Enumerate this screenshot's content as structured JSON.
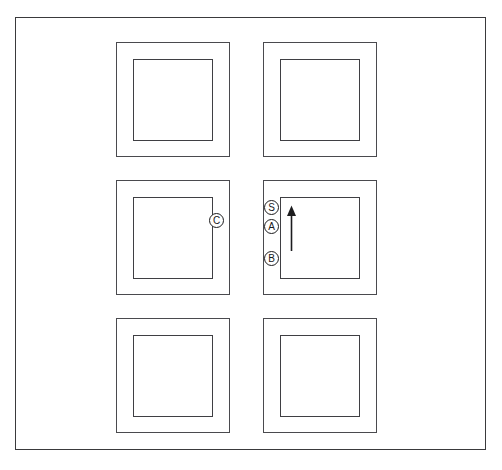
{
  "figure": {
    "background_color": "#ffffff",
    "line_color": "#3f3f43",
    "border_color": "#3a3a3c",
    "caption": ""
  },
  "grid": {
    "rows": 3,
    "columns": 2,
    "cells": [
      {
        "id": "cell-r1c1",
        "row": 1,
        "column": 1,
        "x": 116,
        "y": 42,
        "width": 114,
        "height": 115
      },
      {
        "id": "cell-r1c2",
        "row": 1,
        "column": 2,
        "x": 263,
        "y": 42,
        "width": 114,
        "height": 115
      },
      {
        "id": "cell-r2c1",
        "row": 2,
        "column": 1,
        "x": 116,
        "y": 180,
        "width": 114,
        "height": 115
      },
      {
        "id": "cell-r2c2",
        "row": 2,
        "column": 2,
        "x": 263,
        "y": 180,
        "width": 114,
        "height": 115
      },
      {
        "id": "cell-r3c1",
        "row": 3,
        "column": 1,
        "x": 116,
        "y": 318,
        "width": 114,
        "height": 115
      },
      {
        "id": "cell-r3c2",
        "row": 3,
        "column": 2,
        "x": 263,
        "y": 318,
        "width": 114,
        "height": 115
      }
    ]
  },
  "markers": [
    {
      "id": "marker-c",
      "label": "C",
      "x": 209,
      "y": 213,
      "attached_cell": "cell-r2c1"
    },
    {
      "id": "marker-s",
      "label": "S",
      "x": 264,
      "y": 200,
      "attached_cell": "cell-r2c2"
    },
    {
      "id": "marker-a",
      "label": "A",
      "x": 264,
      "y": 219,
      "attached_cell": "cell-r2c2"
    },
    {
      "id": "marker-b",
      "label": "B",
      "x": 264,
      "y": 251,
      "attached_cell": "cell-r2c2"
    }
  ],
  "arrow": {
    "id": "arrow-up",
    "direction": "up",
    "x": 285,
    "y": 205,
    "length": 46,
    "color": "#1c1c1e",
    "attached_cell": "cell-r2c2"
  }
}
